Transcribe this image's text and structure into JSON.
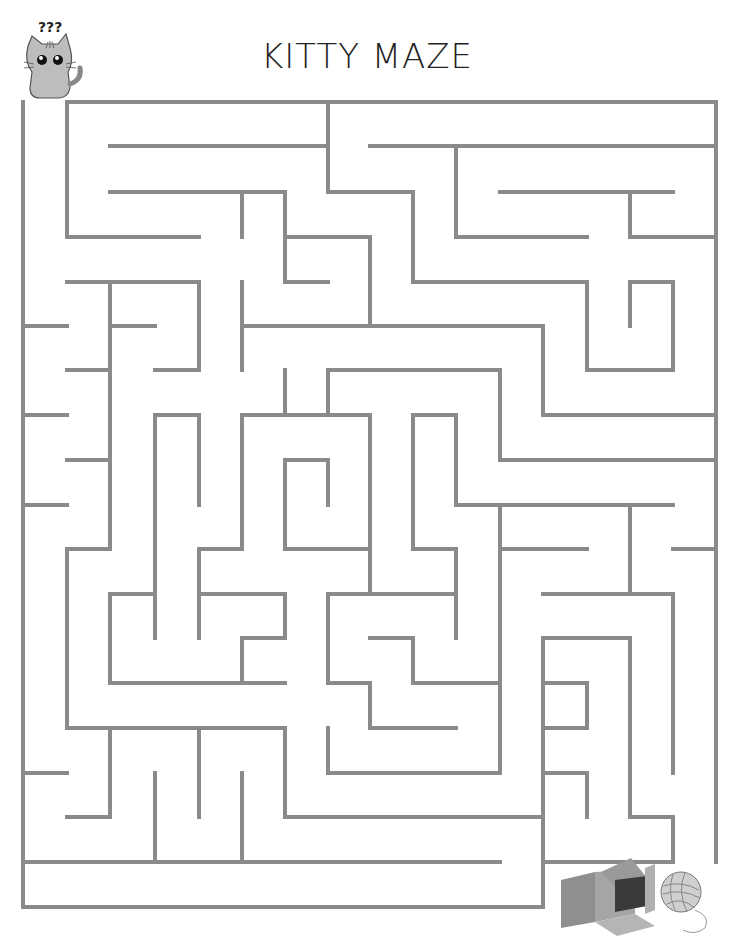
{
  "title": "KITTY MAZE",
  "wall_color": "#8a8a8a",
  "start_icon": "cat-icon",
  "start_label": "???",
  "goal_icons": [
    "box-icon",
    "yarn-ball-icon"
  ],
  "maze": {
    "stroke_width": 4,
    "segments": [
      [
        23,
        102,
        23,
        862
      ],
      [
        67,
        102,
        716,
        102
      ],
      [
        716,
        102,
        716,
        862
      ],
      [
        67,
        102,
        67,
        237
      ],
      [
        67,
        237,
        199,
        237
      ],
      [
        110,
        146,
        328,
        146
      ],
      [
        328,
        102,
        328,
        192
      ],
      [
        328,
        192,
        413,
        192
      ],
      [
        413,
        192,
        413,
        282
      ],
      [
        413,
        282,
        587,
        282
      ],
      [
        370,
        146,
        716,
        146
      ],
      [
        456,
        146,
        456,
        237
      ],
      [
        456,
        237,
        587,
        237
      ],
      [
        500,
        192,
        673,
        192
      ],
      [
        630,
        192,
        630,
        237
      ],
      [
        630,
        237,
        716,
        237
      ],
      [
        110,
        192,
        285,
        192
      ],
      [
        242,
        192,
        242,
        237
      ],
      [
        285,
        192,
        285,
        282
      ],
      [
        285,
        282,
        328,
        282
      ],
      [
        285,
        237,
        370,
        237
      ],
      [
        370,
        237,
        370,
        326
      ],
      [
        242,
        282,
        242,
        370
      ],
      [
        242,
        326,
        543,
        326
      ],
      [
        543,
        326,
        543,
        415
      ],
      [
        543,
        415,
        716,
        415
      ],
      [
        587,
        282,
        587,
        370
      ],
      [
        587,
        370,
        673,
        370
      ],
      [
        673,
        370,
        673,
        282
      ],
      [
        673,
        282,
        630,
        282
      ],
      [
        630,
        282,
        630,
        326
      ],
      [
        67,
        282,
        199,
        282
      ],
      [
        110,
        282,
        110,
        549
      ],
      [
        199,
        282,
        199,
        370
      ],
      [
        199,
        370,
        155,
        370
      ],
      [
        23,
        326,
        67,
        326
      ],
      [
        110,
        326,
        155,
        326
      ],
      [
        67,
        370,
        110,
        370
      ],
      [
        23,
        415,
        67,
        415
      ],
      [
        67,
        460,
        110,
        460
      ],
      [
        23,
        505,
        67,
        505
      ],
      [
        67,
        549,
        110,
        549
      ],
      [
        67,
        549,
        67,
        728
      ],
      [
        285,
        370,
        285,
        415
      ],
      [
        328,
        370,
        500,
        370
      ],
      [
        328,
        370,
        328,
        415
      ],
      [
        500,
        370,
        500,
        460
      ],
      [
        500,
        460,
        716,
        460
      ],
      [
        155,
        415,
        199,
        415
      ],
      [
        155,
        415,
        155,
        638
      ],
      [
        199,
        415,
        199,
        505
      ],
      [
        242,
        415,
        370,
        415
      ],
      [
        242,
        415,
        242,
        549
      ],
      [
        242,
        549,
        199,
        549
      ],
      [
        199,
        549,
        199,
        638
      ],
      [
        370,
        415,
        370,
        594
      ],
      [
        285,
        460,
        328,
        460
      ],
      [
        328,
        460,
        328,
        505
      ],
      [
        285,
        460,
        285,
        549
      ],
      [
        285,
        549,
        370,
        549
      ],
      [
        413,
        415,
        456,
        415
      ],
      [
        413,
        415,
        413,
        549
      ],
      [
        413,
        549,
        456,
        549
      ],
      [
        456,
        549,
        456,
        638
      ],
      [
        456,
        415,
        456,
        505
      ],
      [
        456,
        505,
        673,
        505
      ],
      [
        500,
        505,
        500,
        773
      ],
      [
        500,
        549,
        587,
        549
      ],
      [
        630,
        505,
        630,
        594
      ],
      [
        673,
        549,
        716,
        549
      ],
      [
        543,
        594,
        673,
        594
      ],
      [
        673,
        594,
        673,
        773
      ],
      [
        110,
        594,
        155,
        594
      ],
      [
        110,
        594,
        110,
        683
      ],
      [
        199,
        594,
        285,
        594
      ],
      [
        285,
        594,
        285,
        638
      ],
      [
        285,
        638,
        242,
        638
      ],
      [
        242,
        638,
        242,
        683
      ],
      [
        110,
        683,
        285,
        683
      ],
      [
        328,
        594,
        456,
        594
      ],
      [
        328,
        594,
        328,
        683
      ],
      [
        328,
        683,
        370,
        683
      ],
      [
        370,
        683,
        370,
        728
      ],
      [
        370,
        728,
        456,
        728
      ],
      [
        370,
        638,
        413,
        638
      ],
      [
        413,
        638,
        413,
        683
      ],
      [
        413,
        683,
        500,
        683
      ],
      [
        543,
        638,
        630,
        638
      ],
      [
        630,
        638,
        630,
        817
      ],
      [
        543,
        638,
        543,
        817
      ],
      [
        543,
        683,
        587,
        683
      ],
      [
        587,
        683,
        587,
        728
      ],
      [
        543,
        728,
        587,
        728
      ],
      [
        543,
        773,
        587,
        773
      ],
      [
        587,
        773,
        587,
        817
      ],
      [
        630,
        817,
        673,
        817
      ],
      [
        673,
        817,
        673,
        862
      ],
      [
        543,
        862,
        673,
        862
      ],
      [
        328,
        728,
        328,
        773
      ],
      [
        328,
        773,
        500,
        773
      ],
      [
        67,
        728,
        285,
        728
      ],
      [
        285,
        728,
        285,
        817
      ],
      [
        285,
        817,
        543,
        817
      ],
      [
        543,
        817,
        543,
        907
      ],
      [
        23,
        773,
        67,
        773
      ],
      [
        110,
        728,
        110,
        817
      ],
      [
        110,
        817,
        67,
        817
      ],
      [
        155,
        773,
        155,
        862
      ],
      [
        199,
        728,
        199,
        817
      ],
      [
        242,
        773,
        242,
        862
      ],
      [
        23,
        862,
        500,
        862
      ],
      [
        23,
        862,
        23,
        907
      ],
      [
        23,
        907,
        543,
        907
      ]
    ]
  }
}
